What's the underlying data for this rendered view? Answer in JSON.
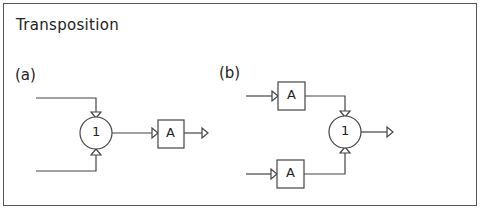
{
  "title": "Transposition",
  "panels": [
    {
      "label": "(a)",
      "summing_node": "1",
      "block": "A"
    },
    {
      "label": "(b)",
      "summing_node": "1",
      "blocks": [
        "A",
        "A"
      ]
    }
  ],
  "colors": {
    "line": "#444444",
    "text": "#222222",
    "background": "#ffffff"
  }
}
